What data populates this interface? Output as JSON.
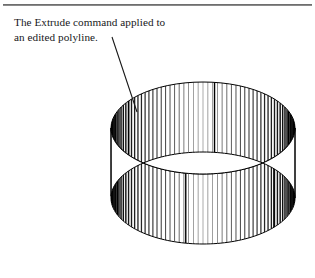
{
  "page": {
    "background_color": "#ffffff",
    "divider": {
      "name": "top-horizontal-rule",
      "color": "#8a8a8a"
    }
  },
  "caption": {
    "text": "The Extrude command applied to\nan edited polyline.",
    "line_1": "The Extrude command applied to",
    "line_2": "an edited polyline.",
    "color": "#17171a"
  },
  "leader": {
    "name": "leader-line",
    "from_x": 112,
    "from_y": 37,
    "to_x": 137,
    "to_y": 112,
    "color": "#1a1a1a"
  },
  "figure": {
    "name": "extruded-polyline-solid",
    "line_color": "#000000",
    "fill_color": "#ffffff",
    "bounds": {
      "x": 110,
      "y": 82,
      "width": 186,
      "height": 162
    },
    "top_ellipse": {
      "cx": 203,
      "cy": 128,
      "rx": 92,
      "ry": 46
    },
    "bottom_ellipse": {
      "cx": 203,
      "cy": 198,
      "rx": 92,
      "ry": 46
    },
    "extrude_height": 70,
    "mesh_line_count": 120
  }
}
